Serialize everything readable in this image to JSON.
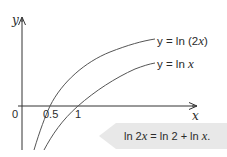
{
  "figure": {
    "axes": {
      "x_label": "x",
      "y_label": "y",
      "origin_label": "0",
      "x_ticks": [
        {
          "label": "0.5",
          "value": 0.5
        },
        {
          "label": "1",
          "value": 1
        }
      ]
    },
    "curves": [
      {
        "name": "ln-2x",
        "label_prefix": "y = ln (2",
        "label_var": "x",
        "label_suffix": ")",
        "expression": "y = ln (2x)",
        "x_intercept": 0.5,
        "color": "#555555"
      },
      {
        "name": "ln-x",
        "label_prefix": "y = ln ",
        "label_var": "x",
        "label_suffix": "",
        "expression": "y = ln x",
        "x_intercept": 1,
        "color": "#555555"
      }
    ],
    "callout": {
      "text_part1": "ln 2",
      "text_var1": "x",
      "text_part2": " = ln 2 + ln ",
      "text_var2": "x",
      "text_part3": ".",
      "full_text": "ln 2x = ln 2 + ln x.",
      "background": "#e8e8e8"
    },
    "colors": {
      "axis": "#333333",
      "curve": "#555555",
      "text": "#2b2b2b",
      "callout_bg": "#e8e8e8"
    }
  }
}
